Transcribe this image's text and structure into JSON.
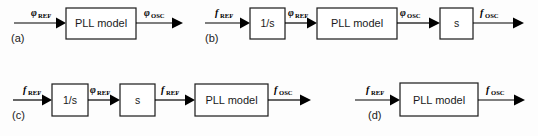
{
  "figure": {
    "background_color": "#fdfdfd",
    "line_color": "#000000",
    "box_fill": "#ffffff",
    "box_stroke": "#222222",
    "width": 538,
    "height": 136
  },
  "signals": {
    "phi_ref": {
      "symbol": "φ",
      "subscript": "REF"
    },
    "phi_osc": {
      "symbol": "φ",
      "subscript": "OSC"
    },
    "f_ref": {
      "symbol": "f",
      "subscript": "REF"
    },
    "f_osc": {
      "symbol": "f",
      "subscript": "OSC"
    }
  },
  "panels": [
    {
      "id": "a",
      "id_label": "(a)",
      "input_label": {
        "symbol": "φ",
        "subscript": "REF"
      },
      "output_label": {
        "symbol": "φ",
        "subscript": "OSC"
      },
      "blocks": [
        {
          "name": "pll-model",
          "label": "PLL model"
        }
      ]
    },
    {
      "id": "b",
      "id_label": "(b)",
      "input_label": {
        "symbol": "f",
        "subscript": "REF"
      },
      "output_label": {
        "symbol": "f",
        "subscript": "OSC"
      },
      "blocks": [
        {
          "name": "integrator",
          "label": "1/s"
        },
        {
          "name": "pll-model",
          "label": "PLL model"
        },
        {
          "name": "differentiator",
          "label": "s"
        }
      ],
      "inter_labels": [
        {
          "symbol": "φ",
          "subscript": "REF"
        },
        {
          "symbol": "φ",
          "subscript": "OSC"
        }
      ]
    },
    {
      "id": "c",
      "id_label": "(c)",
      "input_label": {
        "symbol": "f",
        "subscript": "REF"
      },
      "output_label": {
        "symbol": "f",
        "subscript": "OSC"
      },
      "blocks": [
        {
          "name": "integrator",
          "label": "1/s"
        },
        {
          "name": "differentiator",
          "label": "s"
        },
        {
          "name": "pll-model",
          "label": "PLL model"
        }
      ],
      "inter_labels": [
        {
          "symbol": "φ",
          "subscript": "REF"
        },
        {
          "symbol": "f",
          "subscript": "REF"
        }
      ]
    },
    {
      "id": "d",
      "id_label": "(d)",
      "input_label": {
        "symbol": "f",
        "subscript": "REF"
      },
      "output_label": {
        "symbol": "f",
        "subscript": "OSC"
      },
      "blocks": [
        {
          "name": "pll-model",
          "label": "PLL model"
        }
      ]
    }
  ]
}
